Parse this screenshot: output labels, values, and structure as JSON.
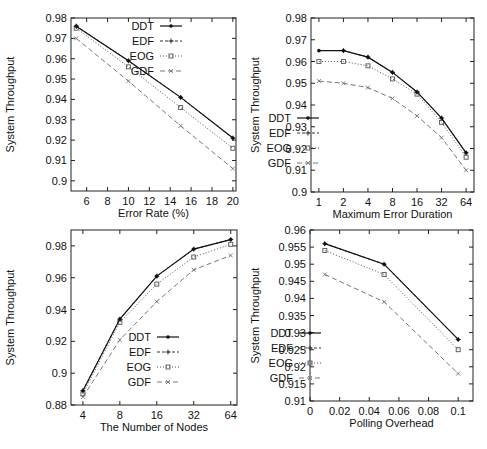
{
  "chart_data": [
    {
      "id": "error-rate",
      "type": "line",
      "title": "",
      "xlabel": "Error Rate (%)",
      "ylabel": "System Throughput",
      "xscale": "linear",
      "xlim": [
        4.5,
        20.3
      ],
      "ylim": [
        0.895,
        0.98
      ],
      "xticks": [
        6,
        8,
        10,
        12,
        14,
        16,
        18,
        20
      ],
      "yticks": [
        0.9,
        0.91,
        0.92,
        0.93,
        0.94,
        0.95,
        0.96,
        0.97,
        0.98
      ],
      "ytick_labels": [
        "0.9",
        "0.91",
        "0.92",
        "0.93",
        "0.94",
        "0.95",
        "0.96",
        "0.97",
        "0.98"
      ],
      "grid": false,
      "legend_position": "top-right",
      "x": [
        5,
        10,
        15,
        20
      ],
      "series": [
        {
          "name": "DDT",
          "values": [
            0.976,
            0.959,
            0.941,
            0.921
          ]
        },
        {
          "name": "EDF",
          "values": [
            0.976,
            0.959,
            0.941,
            0.921
          ]
        },
        {
          "name": "EOG",
          "values": [
            0.975,
            0.956,
            0.936,
            0.916
          ]
        },
        {
          "name": "GDF",
          "values": [
            0.97,
            0.949,
            0.927,
            0.906
          ]
        }
      ]
    },
    {
      "id": "max-error-duration",
      "type": "line",
      "title": "",
      "xlabel": "Maximum Error Duration",
      "ylabel": "System Throughput",
      "xscale": "log2",
      "xlim": [
        0.8,
        80
      ],
      "ylim": [
        0.9,
        0.98
      ],
      "xticks": [
        1,
        2,
        4,
        8,
        16,
        32,
        64
      ],
      "yticks": [
        0.9,
        0.91,
        0.92,
        0.93,
        0.94,
        0.95,
        0.96,
        0.97,
        0.98
      ],
      "ytick_labels": [
        "0.9",
        "0.91",
        "0.92",
        "0.93",
        "0.94",
        "0.95",
        "0.96",
        "0.97",
        "0.98"
      ],
      "grid": false,
      "legend_position": "bottom-left",
      "x": [
        1,
        2,
        4,
        8,
        16,
        32,
        64
      ],
      "series": [
        {
          "name": "DDT",
          "values": [
            0.965,
            0.965,
            0.962,
            0.955,
            0.946,
            0.934,
            0.918
          ]
        },
        {
          "name": "EDF",
          "values": [
            null,
            0.965,
            0.962,
            0.955,
            0.946,
            0.934,
            0.918
          ]
        },
        {
          "name": "EOG",
          "values": [
            0.96,
            0.96,
            0.958,
            0.952,
            0.945,
            0.932,
            0.916
          ]
        },
        {
          "name": "GDF",
          "values": [
            0.951,
            0.95,
            0.948,
            0.943,
            0.935,
            0.925,
            0.91
          ]
        }
      ]
    },
    {
      "id": "number-of-nodes",
      "type": "line",
      "title": "",
      "xlabel": "The Number of Nodes",
      "ylabel": "System Throughput",
      "xscale": "log2",
      "xlim": [
        3.2,
        72
      ],
      "ylim": [
        0.88,
        0.99
      ],
      "xticks": [
        4,
        8,
        16,
        32,
        64
      ],
      "yticks": [
        0.88,
        0.9,
        0.92,
        0.94,
        0.96,
        0.98
      ],
      "ytick_labels": [
        "0.88",
        "0.9",
        "0.92",
        "0.94",
        "0.96",
        "0.98"
      ],
      "grid": false,
      "legend_position": "bottom-right",
      "x": [
        4,
        8,
        16,
        32,
        64
      ],
      "series": [
        {
          "name": "DDT",
          "values": [
            0.889,
            0.934,
            0.961,
            0.978,
            0.984
          ]
        },
        {
          "name": "EDF",
          "values": [
            0.889,
            0.934,
            0.961,
            0.978,
            0.984
          ]
        },
        {
          "name": "EOG",
          "values": [
            0.887,
            0.932,
            0.956,
            0.973,
            0.981
          ]
        },
        {
          "name": "GDF",
          "values": [
            0.885,
            0.921,
            0.945,
            0.965,
            0.974
          ]
        }
      ]
    },
    {
      "id": "polling-overhead",
      "type": "line",
      "title": "",
      "xlabel": "Polling Overhead",
      "ylabel": "System Throughput",
      "xscale": "linear",
      "xlim": [
        0,
        0.11
      ],
      "ylim": [
        0.91,
        0.96
      ],
      "xticks": [
        0,
        0.02,
        0.04,
        0.06,
        0.08,
        0.1
      ],
      "xtick_labels": [
        "0",
        "0.02",
        "0.04",
        "0.06",
        "0.08",
        "0.1"
      ],
      "yticks": [
        0.91,
        0.915,
        0.92,
        0.925,
        0.93,
        0.935,
        0.94,
        0.945,
        0.95,
        0.955,
        0.96
      ],
      "ytick_labels": [
        "0.91",
        "0.915",
        "0.92",
        "0.925",
        "0.93",
        "0.935",
        "0.94",
        "0.945",
        "0.95",
        "0.955",
        "0.96"
      ],
      "grid": false,
      "legend_position": "bottom-left",
      "x": [
        0.01,
        0.05,
        0.1
      ],
      "series": [
        {
          "name": "DDT",
          "values": [
            0.956,
            0.95,
            0.928
          ]
        },
        {
          "name": "EDF",
          "values": [
            0.956,
            0.95,
            0.928
          ]
        },
        {
          "name": "EOG",
          "values": [
            0.954,
            0.947,
            0.925
          ]
        },
        {
          "name": "GDF",
          "values": [
            0.947,
            0.939,
            0.918
          ]
        }
      ]
    }
  ],
  "layout": {
    "panels": [
      {
        "left": 0,
        "top": 0,
        "width": 245,
        "height": 225,
        "frame": [
          71,
          18,
          236,
          191
        ]
      },
      {
        "left": 245,
        "top": 0,
        "width": 242,
        "height": 225,
        "frame": [
          66,
          18,
          229,
          192
        ]
      },
      {
        "left": 0,
        "top": 225,
        "width": 245,
        "height": 224,
        "frame": [
          71,
          5,
          237,
          180
        ]
      },
      {
        "left": 245,
        "top": 225,
        "width": 242,
        "height": 224,
        "frame": [
          65,
          5,
          228,
          176
        ]
      }
    ],
    "legend_boxes": [
      {
        "x": 120,
        "y": 26
      },
      {
        "x": 12,
        "y": 118
      },
      {
        "x": 117,
        "y": 112
      },
      {
        "x": 14,
        "y": 108
      }
    ]
  },
  "series_styles": {
    "DDT": {
      "color": "#111111",
      "dash": "",
      "marker": "dot",
      "width": 1.2
    },
    "EDF": {
      "color": "#333333",
      "dash": "3,2",
      "marker": "plus",
      "width": 1
    },
    "EOG": {
      "color": "#555555",
      "dash": "1,2",
      "marker": "square",
      "width": 1
    },
    "GDF": {
      "color": "#777777",
      "dash": "5,3",
      "marker": "x",
      "width": 1
    }
  }
}
